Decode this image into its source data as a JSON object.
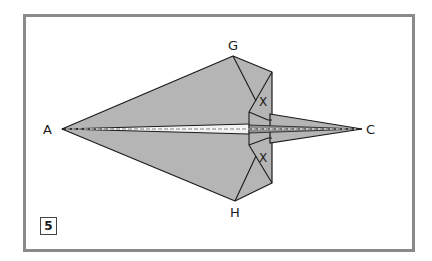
{
  "diagram": {
    "type": "origami-fold-step",
    "step_number": "5",
    "colors": {
      "paper": "#b5b5b5",
      "line": "#1a1a1a",
      "frame": "#8a8a8a",
      "center_strip": "#f2f2f2"
    },
    "points": {
      "A": {
        "label": "A"
      },
      "C": {
        "label": "C"
      },
      "G": {
        "label": "G"
      },
      "H": {
        "label": "H"
      }
    },
    "marks": [
      {
        "label": "X",
        "position": "upper"
      },
      {
        "label": "X",
        "position": "lower"
      }
    ],
    "fold_lines": [
      {
        "kind": "valley-dashed",
        "from": "A",
        "to": "C"
      }
    ]
  }
}
